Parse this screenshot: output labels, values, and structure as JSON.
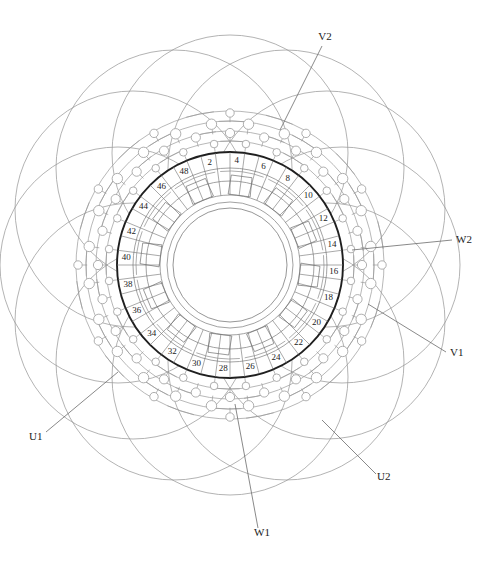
{
  "figure": {
    "kind": "stator-winding-diagram",
    "title": "",
    "canvas": {
      "width": 500,
      "height": 564
    },
    "center": {
      "x": 230,
      "y": 265
    }
  },
  "colors": {
    "stator_outline": "#1f1f1f",
    "thin_line": "#8a8a8a",
    "winding_line": "#9a9a9a",
    "slot_line": "#6f6f6f",
    "text": "#1b1b1b",
    "background": "#ffffff",
    "leader_line": "#6b6b6b"
  },
  "stator": {
    "outer_radius": 113,
    "outer_stroke_width": 1.9,
    "yoke_radius": 97,
    "slot_bottom_radius": 84,
    "slot_top_radius": 70,
    "bore_inner_radius": 57,
    "bore_mid_radius": 63,
    "slot_count": 48,
    "slot_numbers_visible": [
      2,
      4,
      6,
      8,
      10,
      12,
      14,
      16,
      18,
      20,
      22,
      24,
      26,
      28,
      30,
      32,
      34,
      36,
      38,
      40,
      42,
      44,
      46,
      48
    ],
    "number_radius": 104,
    "first_number_angle_deg": 101.25,
    "number_step_deg": -15
  },
  "coils": {
    "trapezoid_count": 12,
    "inner_radius": 71,
    "outer_radius": 90,
    "half_angle_deg": 9,
    "start_angle_deg": 112.5,
    "step_deg": 30
  },
  "end_windings": {
    "big_loop_count": 12,
    "big_loop_radius": 118,
    "big_loop_center_radius": 112,
    "big_loop_start_deg": 0,
    "arc_rings": [
      {
        "radius": 124,
        "count": 12
      },
      {
        "radius": 134,
        "count": 12
      },
      {
        "radius": 144,
        "count": 12
      },
      {
        "radius": 154,
        "count": 12
      }
    ],
    "node_rings": [
      {
        "radius": 122,
        "count": 24,
        "dot_radius": 3.8,
        "offset_deg": 7.5
      },
      {
        "radius": 132,
        "count": 24,
        "dot_radius": 4.6,
        "offset_deg": 0
      },
      {
        "radius": 142,
        "count": 24,
        "dot_radius": 5.2,
        "offset_deg": 7.5
      },
      {
        "radius": 152,
        "count": 12,
        "dot_radius": 4.2,
        "offset_deg": 0
      }
    ]
  },
  "terminals": [
    {
      "name": "V2",
      "label": "V2",
      "text_x": 325,
      "text_y": 40,
      "anchor": "middle",
      "leader": [
        [
          322,
          46
        ],
        [
          280,
          130
        ]
      ]
    },
    {
      "name": "W2",
      "label": "W2",
      "text_x": 456,
      "text_y": 243,
      "anchor": "start",
      "leader": [
        [
          452,
          240
        ],
        [
          352,
          250
        ]
      ]
    },
    {
      "name": "V1",
      "label": "V1",
      "text_x": 450,
      "text_y": 356,
      "anchor": "start",
      "leader": [
        [
          446,
          352
        ],
        [
          368,
          304
        ]
      ]
    },
    {
      "name": "U2",
      "label": "U2",
      "text_x": 377,
      "text_y": 480,
      "anchor": "start",
      "leader": [
        [
          376,
          474
        ],
        [
          322,
          420
        ]
      ]
    },
    {
      "name": "W1",
      "label": "W1",
      "text_x": 262,
      "text_y": 536,
      "anchor": "middle",
      "leader": [
        [
          258,
          528
        ],
        [
          235,
          404
        ]
      ]
    },
    {
      "name": "U1",
      "label": "U1",
      "text_x": 29,
      "text_y": 440,
      "anchor": "start",
      "leader": [
        [
          46,
          432
        ],
        [
          118,
          372
        ]
      ]
    }
  ]
}
